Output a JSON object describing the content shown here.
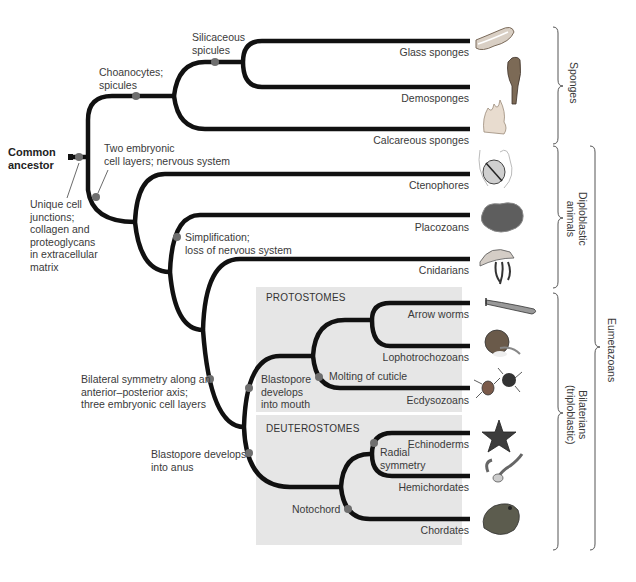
{
  "figure": {
    "type": "phylogenetic-tree",
    "root_label": "Common ancestor",
    "root_trait": "Unique cell junctions; collagen and proteoglycans in extracellular matrix"
  },
  "characters": [
    {
      "id": "choanocytes",
      "label": "Choanocytes;\nspicules"
    },
    {
      "id": "silicaceous",
      "label": "Silicaceous\nspicules"
    },
    {
      "id": "two_layers",
      "label": "Two embryonic\ncell layers; nervous system"
    },
    {
      "id": "simplification",
      "label": "Simplification;\nloss of nervous system"
    },
    {
      "id": "bilateral",
      "label": "Bilateral symmetry along an\nanterior–posterior axis;\nthree embryonic cell layers"
    },
    {
      "id": "blastopore_mouth",
      "label": "Blastopore\ndevelops\ninto mouth"
    },
    {
      "id": "molting",
      "label": "Molting of cuticle"
    },
    {
      "id": "blastopore_anus",
      "label": "Blastopore develops\ninto anus"
    },
    {
      "id": "radial",
      "label": "Radial\nsymmetry"
    },
    {
      "id": "notochord",
      "label": "Notochord"
    }
  ],
  "root": {
    "label": "Common\nancestor",
    "trait": "Unique cell\njunctions;\ncollagen and\nproteoglycans\nin extracellular\nmatrix"
  },
  "taxa": [
    {
      "name": "Glass sponges",
      "icon": "glass-sponge-illustration"
    },
    {
      "name": "Demosponges",
      "icon": "demosponge-illustration"
    },
    {
      "name": "Calcareous sponges",
      "icon": "calcareous-sponge-illustration"
    },
    {
      "name": "Ctenophores",
      "icon": "ctenophore-illustration"
    },
    {
      "name": "Placozoans",
      "icon": "placozoan-illustration"
    },
    {
      "name": "Cnidarians",
      "icon": "jellyfish-illustration"
    },
    {
      "name": "Arrow worms",
      "icon": "arrow-worm-illustration"
    },
    {
      "name": "Lophotrochozoans",
      "icon": "nautilus-illustration"
    },
    {
      "name": "Ecdysozoans",
      "icon": "mite-illustration"
    },
    {
      "name": "Echinoderms",
      "icon": "sea-star-illustration"
    },
    {
      "name": "Hemichordates",
      "icon": "acorn-worm-illustration"
    },
    {
      "name": "Chordates",
      "icon": "frog-illustration"
    }
  ],
  "panels": {
    "protostomes": "PROTOSTOMES",
    "deuterostomes": "DEUTEROSTOMES"
  },
  "brackets": {
    "sponges": "Sponges",
    "diploblastic": "Diploblastic\nanimals",
    "bilaterians": "Bilaterians\n(triploblastic)",
    "eumetazoans": "Eumetazoans"
  },
  "colors": {
    "branch": "#111111",
    "node_dot": "#6e6e6e",
    "panel_bg": "#e6e6e6",
    "text": "#3a3a3a"
  }
}
